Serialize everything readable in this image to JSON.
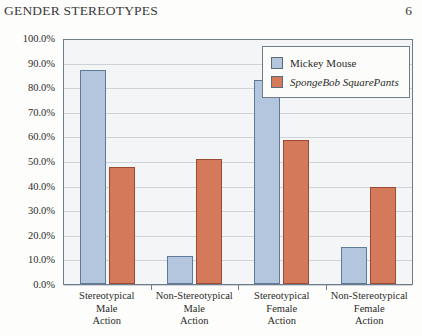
{
  "page": {
    "header_title": "GENDER STEREOTYPES",
    "page_number": "6"
  },
  "legend": {
    "items": [
      {
        "label": "Mickey Mouse",
        "color": "#b3c6dd",
        "italic": false
      },
      {
        "label": "SpongeBob SquarePants",
        "color": "#d4795a",
        "italic": true
      }
    ]
  },
  "chart_data": {
    "type": "bar",
    "title": "",
    "xlabel": "",
    "ylabel": "",
    "ylim": [
      0,
      100
    ],
    "ytick_labels": [
      "100.0%",
      "90.0%",
      "80.0%",
      "70.0%",
      "60.0%",
      "50.0%",
      "40.0%",
      "30.0%",
      "20.0%",
      "10.0%",
      "0.0%"
    ],
    "ytick_values": [
      100,
      90,
      80,
      70,
      60,
      50,
      40,
      30,
      20,
      10,
      0
    ],
    "grid": true,
    "legend_position": "top-right",
    "categories": [
      [
        "Stereotypical",
        "Male",
        "Action"
      ],
      [
        "Non-Stereotypical",
        "Male",
        "Action"
      ],
      [
        "Stereotypical",
        "Female",
        "Action"
      ],
      [
        "Non-Stereotypical",
        "Female",
        "Action"
      ]
    ],
    "series": [
      {
        "name": "Mickey Mouse",
        "color": "#b3c6dd",
        "values": [
          87.0,
          11.5,
          83.0,
          15.0
        ]
      },
      {
        "name": "SpongeBob SquarePants",
        "color": "#d4795a",
        "values": [
          47.5,
          51.0,
          58.5,
          39.5
        ]
      }
    ]
  }
}
